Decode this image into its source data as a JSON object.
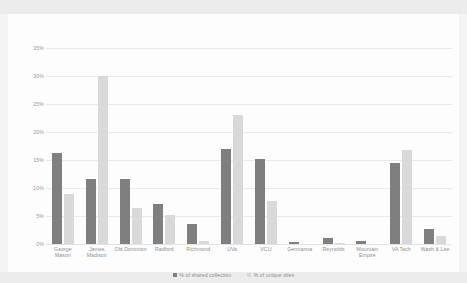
{
  "chart_data": {
    "type": "bar",
    "title": "",
    "xlabel": "",
    "ylabel": "",
    "ylim": [
      0,
      35
    ],
    "ytick_labels": [
      "35%",
      "30%",
      "25%",
      "20%",
      "15%",
      "10%",
      "5%",
      "0%"
    ],
    "ytick_values": [
      35,
      30,
      25,
      20,
      15,
      10,
      5,
      0
    ],
    "grid": true,
    "legend_position": "bottom",
    "categories": [
      "George Mason",
      "James Madison",
      "Old Dominion",
      "Radford",
      "Richmond",
      "UVa",
      "VCU",
      "Germanna",
      "Reynolds",
      "Mountain Empire",
      "VA Tech",
      "Wash & Lee"
    ],
    "series": [
      {
        "name": "% of shared collection",
        "color": "#7f7f7f",
        "values": [
          16.3,
          11.6,
          11.6,
          7.2,
          3.5,
          17.0,
          15.2,
          0.3,
          1.1,
          0.5,
          14.5,
          2.7
        ]
      },
      {
        "name": "% of unique titles",
        "color": "#d9d9d9",
        "values": [
          9.0,
          30.0,
          6.5,
          5.2,
          0.6,
          23.0,
          7.7,
          0.0,
          0.2,
          0.0,
          16.8,
          1.5
        ]
      }
    ]
  },
  "legend": {
    "items": [
      {
        "label": "% of shared collection",
        "marker": "square-swatch-dark"
      },
      {
        "label": "% of unique titles",
        "marker": "square-swatch-light"
      }
    ]
  },
  "colors": {
    "shared": "#7f7f7f",
    "unique": "#d9d9d9",
    "gridline": "#eaeaea",
    "text": "#8f8f8f",
    "plot_background": "#fdfdfd",
    "page_background": "#f2f2f2"
  }
}
